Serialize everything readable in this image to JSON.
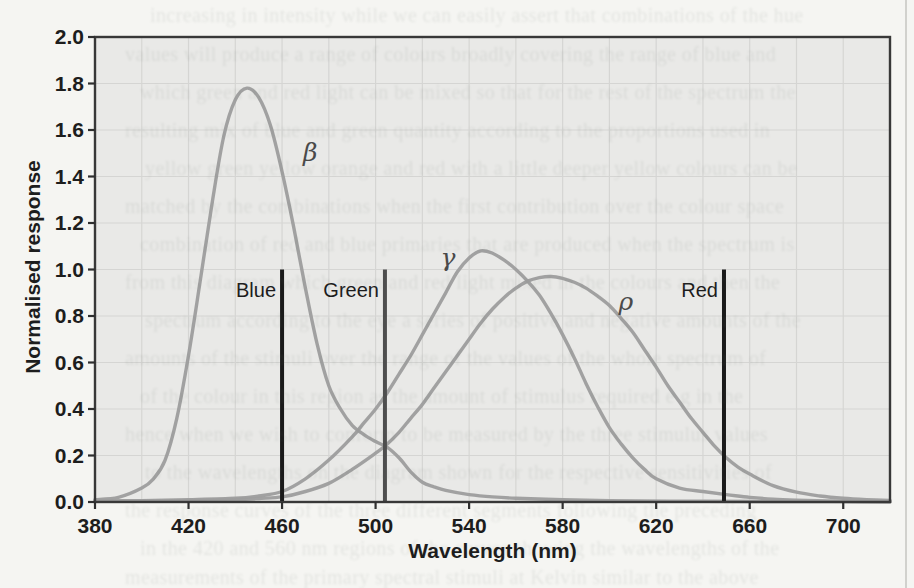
{
  "page": {
    "kind": "scanned-book-page-with-figure",
    "background_color": "#f5f5f2",
    "page_edge_line_x": 905,
    "bleed_text": {
      "note": "faint show-through text from the other side of the page; illegible in source, transcription approximate",
      "lines": [
        {
          "y": 16,
          "x": 150,
          "text": "increasing in intensity while we can easily assert that combinations of the hue"
        },
        {
          "y": 55,
          "x": 125,
          "text": "values will produce a range of colours broadly covering the range of blue and"
        },
        {
          "y": 93,
          "x": 140,
          "text": "which green and red light can be mixed so that for the rest of the spectrum the"
        },
        {
          "y": 131,
          "x": 125,
          "text": "resulting mix of blue and green quantity according to the proportions used in"
        },
        {
          "y": 169,
          "x": 145,
          "text": "yellow green yellow orange and red with a little deeper yellow colours can be"
        },
        {
          "y": 207,
          "x": 125,
          "text": "matched by the combinations when the first contribution over the colour space"
        },
        {
          "y": 245,
          "x": 140,
          "text": "combination of red and blue primaries that are produced when the spectrum is"
        },
        {
          "y": 283,
          "x": 125,
          "text": "from this diagram which green and red light mixed in the colours and then the"
        },
        {
          "y": 321,
          "x": 145,
          "text": "spectrum according to the eye a series of positive and negative amounts of the"
        },
        {
          "y": 359,
          "x": 125,
          "text": "amounts of the stimuli over the range of the values of the whole spectrum of"
        },
        {
          "y": 397,
          "x": 140,
          "text": "of the colour in this region as the amount of stimulus required e g in the"
        },
        {
          "y": 435,
          "x": 125,
          "text": "hence when we wish to conform to be measured by the three stimulus values"
        },
        {
          "y": 473,
          "x": 145,
          "text": "to the wavelengths on the diagram shown for the respective sensitivities of"
        },
        {
          "y": 511,
          "x": 125,
          "text": "the response curves of the three different segments following the preceding"
        },
        {
          "y": 549,
          "x": 140,
          "text": "in the 420 and 560 nm regions of the curves showing the wavelengths of the"
        },
        {
          "y": 578,
          "x": 125,
          "text": "measurements of the primary spectral stimuli at Kelvin similar to the above"
        }
      ]
    }
  },
  "chart_data": {
    "type": "line",
    "title": "",
    "xlabel": "Wavelength (nm)",
    "ylabel": "Normalised response",
    "x_range": [
      380,
      720
    ],
    "y_range": [
      0,
      2.0
    ],
    "x_ticks": [
      380,
      420,
      460,
      500,
      540,
      580,
      620,
      660,
      700
    ],
    "y_ticks": [
      "0.0",
      "0.2",
      "0.4",
      "0.6",
      "0.8",
      "1.0",
      "1.2",
      "1.4",
      "1.6",
      "1.8",
      "2.0"
    ],
    "grid": {
      "show": true,
      "x_step": 20,
      "y_step": 0.2
    },
    "legend_position": "none",
    "series": [
      {
        "name": "beta-cone-response",
        "label": "β",
        "peak": {
          "x": 445,
          "y": 1.78
        },
        "label_pos": [
          472,
          1.5
        ],
        "points": [
          [
            380,
            0.01
          ],
          [
            390,
            0.02
          ],
          [
            400,
            0.06
          ],
          [
            405,
            0.1
          ],
          [
            410,
            0.18
          ],
          [
            415,
            0.36
          ],
          [
            420,
            0.63
          ],
          [
            425,
            0.95
          ],
          [
            430,
            1.28
          ],
          [
            435,
            1.57
          ],
          [
            440,
            1.73
          ],
          [
            445,
            1.78
          ],
          [
            450,
            1.74
          ],
          [
            455,
            1.62
          ],
          [
            460,
            1.42
          ],
          [
            465,
            1.18
          ],
          [
            470,
            0.92
          ],
          [
            475,
            0.68
          ],
          [
            480,
            0.5
          ],
          [
            485,
            0.4
          ],
          [
            490,
            0.33
          ],
          [
            495,
            0.29
          ],
          [
            500,
            0.26
          ],
          [
            505,
            0.235
          ],
          [
            510,
            0.19
          ],
          [
            515,
            0.13
          ],
          [
            520,
            0.085
          ],
          [
            525,
            0.065
          ],
          [
            530,
            0.05
          ],
          [
            540,
            0.032
          ],
          [
            550,
            0.022
          ],
          [
            560,
            0.016
          ],
          [
            580,
            0.01
          ],
          [
            600,
            0.006
          ],
          [
            640,
            0.003
          ],
          [
            680,
            0.002
          ],
          [
            720,
            0.001
          ]
        ]
      },
      {
        "name": "gamma-cone-response",
        "label": "γ",
        "peak": {
          "x": 545,
          "y": 1.08
        },
        "label_pos": [
          531,
          1.05
        ],
        "points": [
          [
            380,
            0.004
          ],
          [
            400,
            0.006
          ],
          [
            420,
            0.01
          ],
          [
            440,
            0.016
          ],
          [
            450,
            0.026
          ],
          [
            460,
            0.045
          ],
          [
            470,
            0.1
          ],
          [
            480,
            0.18
          ],
          [
            490,
            0.28
          ],
          [
            495,
            0.34
          ],
          [
            500,
            0.4
          ],
          [
            505,
            0.47
          ],
          [
            510,
            0.55
          ],
          [
            515,
            0.63
          ],
          [
            520,
            0.72
          ],
          [
            525,
            0.81
          ],
          [
            530,
            0.9
          ],
          [
            535,
            0.99
          ],
          [
            540,
            1.05
          ],
          [
            545,
            1.08
          ],
          [
            550,
            1.07
          ],
          [
            555,
            1.04
          ],
          [
            560,
            1.0
          ],
          [
            565,
            0.95
          ],
          [
            570,
            0.89
          ],
          [
            575,
            0.81
          ],
          [
            580,
            0.72
          ],
          [
            585,
            0.62
          ],
          [
            590,
            0.51
          ],
          [
            595,
            0.41
          ],
          [
            600,
            0.32
          ],
          [
            605,
            0.25
          ],
          [
            610,
            0.19
          ],
          [
            615,
            0.14
          ],
          [
            620,
            0.1
          ],
          [
            630,
            0.06
          ],
          [
            640,
            0.045
          ],
          [
            650,
            0.032
          ],
          [
            660,
            0.02
          ],
          [
            670,
            0.012
          ],
          [
            680,
            0.008
          ],
          [
            700,
            0.003
          ],
          [
            720,
            0.001
          ]
        ]
      },
      {
        "name": "rho-cone-response",
        "label": "ρ",
        "peak": {
          "x": 575,
          "y": 0.97
        },
        "label_pos": [
          607,
          0.86
        ],
        "points": [
          [
            380,
            0.003
          ],
          [
            400,
            0.004
          ],
          [
            420,
            0.006
          ],
          [
            440,
            0.01
          ],
          [
            450,
            0.015
          ],
          [
            460,
            0.022
          ],
          [
            470,
            0.045
          ],
          [
            480,
            0.08
          ],
          [
            490,
            0.14
          ],
          [
            500,
            0.21
          ],
          [
            505,
            0.25
          ],
          [
            510,
            0.3
          ],
          [
            515,
            0.36
          ],
          [
            520,
            0.42
          ],
          [
            525,
            0.49
          ],
          [
            530,
            0.56
          ],
          [
            535,
            0.63
          ],
          [
            540,
            0.7
          ],
          [
            545,
            0.77
          ],
          [
            550,
            0.83
          ],
          [
            555,
            0.88
          ],
          [
            560,
            0.92
          ],
          [
            565,
            0.95
          ],
          [
            570,
            0.965
          ],
          [
            575,
            0.97
          ],
          [
            580,
            0.962
          ],
          [
            585,
            0.945
          ],
          [
            590,
            0.92
          ],
          [
            595,
            0.885
          ],
          [
            600,
            0.845
          ],
          [
            605,
            0.79
          ],
          [
            610,
            0.73
          ],
          [
            615,
            0.655
          ],
          [
            620,
            0.58
          ],
          [
            625,
            0.5
          ],
          [
            630,
            0.43
          ],
          [
            635,
            0.36
          ],
          [
            640,
            0.3
          ],
          [
            645,
            0.24
          ],
          [
            650,
            0.19
          ],
          [
            655,
            0.15
          ],
          [
            660,
            0.12
          ],
          [
            670,
            0.07
          ],
          [
            680,
            0.042
          ],
          [
            690,
            0.026
          ],
          [
            700,
            0.016
          ],
          [
            710,
            0.01
          ],
          [
            720,
            0.007
          ]
        ]
      }
    ],
    "marker_lines": [
      {
        "label": "Blue",
        "x": 460,
        "y_span": [
          0,
          1.0
        ],
        "color": "#1a1a1a"
      },
      {
        "label": "Green",
        "x": 504,
        "y_span": [
          0,
          1.0
        ],
        "color": "#4e4e4e"
      },
      {
        "label": "Red",
        "x": 649,
        "y_span": [
          0,
          1.0
        ],
        "color": "#1a1a1a"
      }
    ],
    "colors": {
      "curve": "#9d9d9d",
      "grid": "#d5d5d3",
      "plot_bg": "#e9e9e7",
      "frame": "#383838",
      "tick": "#2f2f2f",
      "text": "#1d1d1d",
      "marker_label": "#1c1c1c",
      "greek_label": "#4a4a4a"
    }
  }
}
